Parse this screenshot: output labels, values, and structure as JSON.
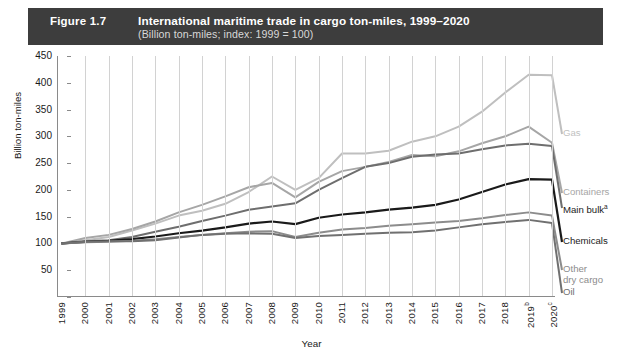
{
  "header": {
    "figure_number": "Figure 1.7",
    "title": "International maritime trade in cargo ton-miles, 1999–2020",
    "subtitle": "(Billion ton-miles; index: 1999 = 100)",
    "bar_color": "#3d3d3d",
    "text_color": "#ffffff"
  },
  "chart_data": {
    "type": "line",
    "title": "International maritime trade in cargo ton-miles, 1999–2020",
    "subtitle": "(Billion ton-miles; index: 1999 = 100)",
    "xlabel": "Year",
    "ylabel": "Billion ton-miles",
    "grid": "vertical",
    "legend_position": "right-inline",
    "ylim": [
      0,
      450
    ],
    "yticks": [
      0,
      50,
      100,
      150,
      200,
      250,
      300,
      350,
      400,
      450
    ],
    "ytick_labels": [
      "",
      "50",
      "100",
      "150",
      "200",
      "250",
      "300",
      "350",
      "400",
      "450"
    ],
    "categories": [
      "1999",
      "2000",
      "2001",
      "2002",
      "2003",
      "2004",
      "2005",
      "2006",
      "2007",
      "2008",
      "2009",
      "2010",
      "2011",
      "2012",
      "2013",
      "2014",
      "2015",
      "2016",
      "2017",
      "2018",
      "2019",
      "2020"
    ],
    "xtick_labels": [
      "1999",
      "2000",
      "2001",
      "2002",
      "2003",
      "2004",
      "2005",
      "2006",
      "2007",
      "2008",
      "2009",
      "2010",
      "2011",
      "2012",
      "2013",
      "2014",
      "2015",
      "2016",
      "2017",
      "2018",
      "2019",
      "2020"
    ],
    "xtick_superscripts": [
      "",
      "",
      "",
      "",
      "",
      "",
      "",
      "",
      "",
      "",
      "",
      "",
      "",
      "",
      "",
      "",
      "",
      "",
      "",
      "",
      "b",
      "c"
    ],
    "series": [
      {
        "name": "Gas",
        "label": "Gas",
        "color": "#bfbfbf",
        "width": 2.0,
        "label_y": 78,
        "values": [
          100,
          106,
          112,
          124,
          137,
          152,
          161,
          174,
          196,
          225,
          200,
          222,
          268,
          268,
          273,
          290,
          300,
          318,
          346,
          382,
          415,
          414
        ]
      },
      {
        "name": "Containers",
        "label": "Containers",
        "color": "#a6a6a6",
        "width": 2.0,
        "label_y": 137,
        "values": [
          100,
          110,
          116,
          127,
          141,
          158,
          172,
          188,
          205,
          213,
          186,
          215,
          235,
          243,
          252,
          265,
          263,
          272,
          287,
          300,
          318,
          288
        ]
      },
      {
        "name": "Main bulk",
        "label": "Main bulk",
        "label_superscript": "a",
        "color": "#6e6e6e",
        "width": 2.0,
        "label_y": 152,
        "values": [
          100,
          104,
          106,
          112,
          122,
          131,
          142,
          152,
          163,
          169,
          175,
          200,
          222,
          243,
          250,
          262,
          266,
          268,
          276,
          283,
          286,
          282
        ]
      },
      {
        "name": "Chemicals",
        "label": "Chemicals",
        "color": "#1a1a1a",
        "width": 2.2,
        "label_y": 186,
        "values": [
          100,
          103,
          105,
          108,
          113,
          119,
          124,
          130,
          137,
          141,
          136,
          148,
          154,
          158,
          163,
          167,
          172,
          182,
          196,
          210,
          220,
          219
        ]
      },
      {
        "name": "Other dry cargo",
        "label": "Other\ndry cargo",
        "label_line1": "Other",
        "label_line2": "dry cargo",
        "color": "#8c8c8c",
        "width": 2.0,
        "label_y": 214,
        "values": [
          100,
          102,
          103,
          105,
          108,
          112,
          116,
          119,
          122,
          123,
          112,
          120,
          126,
          129,
          133,
          136,
          139,
          142,
          147,
          153,
          158,
          152
        ]
      },
      {
        "name": "Oil",
        "label": "Oil",
        "color": "#707070",
        "width": 2.0,
        "label_y": 237,
        "values": [
          100,
          103,
          104,
          104,
          106,
          111,
          116,
          118,
          119,
          118,
          110,
          114,
          116,
          118,
          120,
          121,
          124,
          130,
          136,
          140,
          144,
          138
        ]
      }
    ]
  }
}
